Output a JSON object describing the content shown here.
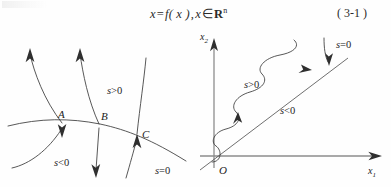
{
  "page": {
    "width": 391,
    "height": 187,
    "background": "#fefefe"
  },
  "equation": {
    "lhs": "x",
    "equals": "=",
    "rhs": "f( x )",
    "comma": ",",
    "var": "x",
    "member": "∈",
    "space_set": "R",
    "exponent": "n",
    "number": "( 3-1 )"
  },
  "figure_left": {
    "name": "phase-portrait-switching-surface",
    "labels": {
      "point_a": "A",
      "point_b": "B",
      "point_c": "C",
      "s_pos": "s>0",
      "s_neg": "s<0",
      "s_zero": "s=0"
    },
    "label_parts": {
      "s_symbol": "s",
      "gt_zero": ">0",
      "lt_zero": "<0",
      "eq_zero": "=0"
    }
  },
  "figure_right": {
    "name": "sliding-mode-trajectory-plot",
    "axes": {
      "x_axis_label": "x",
      "x_axis_sub": "1",
      "y_axis_label": "x",
      "y_axis_sub": "2",
      "origin": "O"
    },
    "labels": {
      "s_pos": "s>0",
      "s_neg": "s<0",
      "s_zero": "s=0"
    },
    "label_parts": {
      "s_symbol": "s",
      "gt_zero": ">0",
      "lt_zero": "<0",
      "eq_zero": "=0"
    }
  },
  "colors": {
    "curve": "#3a3a3a",
    "axis": "#8d8d8d",
    "text": "#232323",
    "background": "#fefefe"
  }
}
